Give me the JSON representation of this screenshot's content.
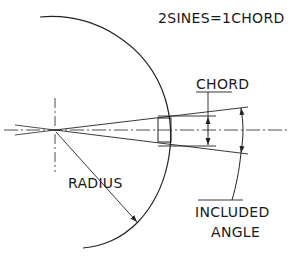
{
  "diagram": {
    "title": "2SINES=1CHORD",
    "labels": {
      "chord": "CHORD",
      "radius": "RADIUS",
      "included_line1": "INCLUDED",
      "included_line2": "ANGLE"
    },
    "colors": {
      "ink": "#222222",
      "background": "#ffffff"
    }
  }
}
